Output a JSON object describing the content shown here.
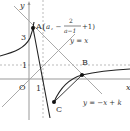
{
  "diagram": {
    "axes": {
      "x_label": "x",
      "y_label": "y",
      "origin_label": "O",
      "x_tick": "1",
      "y_ticks": [
        "1",
        "3"
      ]
    },
    "points": {
      "A": {
        "label": "A",
        "coords_label": "(a, −2/(a−1)+1)",
        "coord_a": "a",
        "frac_num": "2",
        "frac_den": "a−1",
        "suffix": "+1)"
      },
      "B": {
        "label": "B"
      },
      "C": {
        "label": "C"
      }
    },
    "lines": {
      "identity": "y = x",
      "secant": "y = −x + k"
    },
    "colors": {
      "curve": "#222222",
      "axis": "#999999",
      "guide": "#aaaaaa",
      "text": "#333333"
    }
  }
}
